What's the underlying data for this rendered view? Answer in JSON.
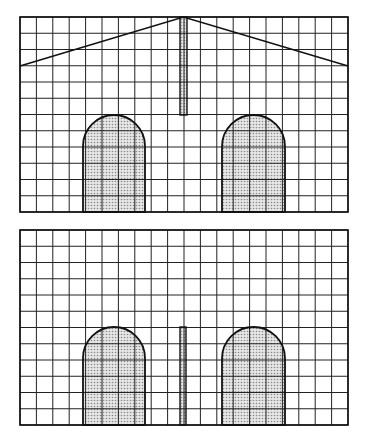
{
  "figure": {
    "grid": {
      "cell_px": 16.3,
      "line_color": "#222222",
      "stroke_width": 1
    },
    "fill_pattern_color": "#bdbdbd",
    "panels": [
      {
        "name": "top-elevation",
        "x": 20,
        "y": 17,
        "width": 328,
        "height": 195,
        "cols": 20,
        "rows": 12,
        "gable": {
          "left_y": 66,
          "right_y": 66,
          "peak_x": 183.5,
          "peak_y": 17
        },
        "bar": {
          "x": 180,
          "y": 17,
          "width": 7,
          "height": 98
        },
        "arches": [
          {
            "x": 83,
            "y": 115,
            "width": 62,
            "height": 97
          },
          {
            "x": 222,
            "y": 115,
            "width": 63,
            "height": 97
          }
        ]
      },
      {
        "name": "bottom-elevation",
        "x": 20,
        "y": 230,
        "width": 328,
        "height": 195,
        "cols": 20,
        "rows": 12,
        "bar": {
          "x": 180,
          "y": 327,
          "width": 6,
          "height": 98
        },
        "arches": [
          {
            "x": 83,
            "y": 327,
            "width": 62,
            "height": 98
          },
          {
            "x": 222,
            "y": 327,
            "width": 63,
            "height": 98
          }
        ]
      }
    ]
  },
  "caption": {
    "text": ""
  }
}
